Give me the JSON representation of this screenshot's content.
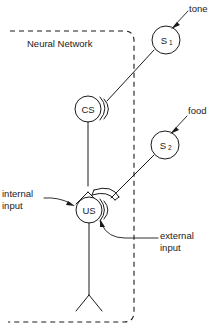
{
  "diagram": {
    "boundary_label": "Neural Network",
    "colors": {
      "stroke": "#1a1a1a",
      "background": "#ffffff"
    },
    "nodes": [
      {
        "id": "s1",
        "label": "S",
        "subscript": "1",
        "cx": 166,
        "cy": 40,
        "r": 14
      },
      {
        "id": "cs",
        "label": "CS",
        "subscript": "",
        "cx": 88,
        "cy": 109,
        "r": 13
      },
      {
        "id": "s2",
        "label": "S",
        "subscript": "2",
        "cx": 165,
        "cy": 145,
        "r": 14
      },
      {
        "id": "us",
        "label": "US",
        "subscript": "",
        "cx": 89,
        "cy": 210,
        "r": 13
      }
    ],
    "annotations": [
      {
        "id": "tone",
        "text": "tone",
        "target": "s1"
      },
      {
        "id": "food",
        "text": "food",
        "target": "s2"
      },
      {
        "id": "internal-input",
        "line1": "internal",
        "line2": "input",
        "target": "us"
      },
      {
        "id": "external-input",
        "line1": "external",
        "line2": "input",
        "target": "us"
      }
    ],
    "connections": [
      {
        "from": "s1",
        "to": "cs",
        "kind": "axon-synapse"
      },
      {
        "from": "cs",
        "to": "us",
        "kind": "axon-synapse"
      },
      {
        "from": "s2",
        "to": "us",
        "kind": "axon-synapse"
      }
    ]
  }
}
